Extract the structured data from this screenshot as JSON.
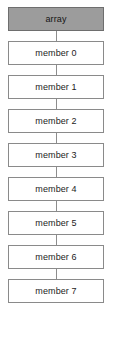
{
  "diagram": {
    "type": "vertical-chain",
    "canvas": {
      "width": 113,
      "height": 337,
      "background": "#ffffff"
    },
    "style": {
      "header_fill": "#9c9c9c",
      "header_border": "#6e6e6e",
      "member_fill": "#ffffff",
      "member_border": "#8a8a8a",
      "connector_color": "#8d8d8d",
      "text_color": "#1c1c1c"
    },
    "header": {
      "label": "array"
    },
    "nodes": [
      {
        "label": "member 0"
      },
      {
        "label": "member 1"
      },
      {
        "label": "member 2"
      },
      {
        "label": "member 3"
      },
      {
        "label": "member 4"
      },
      {
        "label": "member 5"
      },
      {
        "label": "member 6"
      },
      {
        "label": "member 7"
      }
    ]
  }
}
